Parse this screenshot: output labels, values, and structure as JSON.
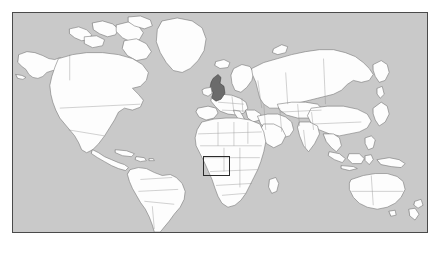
{
  "app": {
    "title": "World Map",
    "view_name": "world-equirectangular"
  },
  "map": {
    "projection": "equirectangular",
    "ocean_color": "#c9c9c9",
    "land_color": "#fdfdfd",
    "border_color": "#8d8d8d",
    "coast_color": "#6e6e6e",
    "frame_color": "#4a4a4a",
    "frame": {
      "x": 12,
      "y": 12,
      "width": 416,
      "height": 221
    },
    "lon_range": [
      -180,
      180
    ],
    "lat_range": [
      -60,
      84
    ]
  },
  "highlight": {
    "country_label": "United Kingdom",
    "country_fill": "#6b6b6b",
    "selected": true
  },
  "roi": {
    "label": "region-of-interest",
    "description": "West Africa / Gulf of Guinea",
    "stroke_color": "#2b2b2b",
    "x": 190,
    "y": 143,
    "width": 27,
    "height": 20
  },
  "continents": [
    {
      "name": "North America"
    },
    {
      "name": "South America"
    },
    {
      "name": "Europe"
    },
    {
      "name": "Africa"
    },
    {
      "name": "Asia"
    },
    {
      "name": "Oceania"
    }
  ],
  "chart_data": {
    "type": "map",
    "title": "World Map",
    "projection": "equirectangular",
    "xlabel": "Longitude",
    "ylabel": "Latitude",
    "xlim": [
      -180,
      180
    ],
    "ylim": [
      -60,
      84
    ],
    "grid": false,
    "legend": "none",
    "annotations": [
      {
        "kind": "highlighted-country",
        "name": "United Kingdom",
        "fill": "#6b6b6b",
        "approx_lonlat": [
          -2.5,
          54.0
        ]
      },
      {
        "kind": "rectangle",
        "name": "region-of-interest",
        "stroke": "#2b2b2b",
        "lon_min": -20.0,
        "lon_max": 3.5,
        "lat_min": 0.5,
        "lat_max": 14.0
      }
    ]
  }
}
